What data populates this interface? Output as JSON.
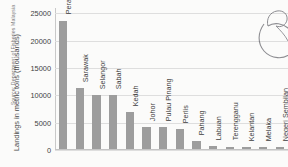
{
  "figure": {
    "source_note": "Source: Department of Fisheries Malaysia",
    "artifact": "pen-scribble-artifact"
  },
  "chart_data": {
    "type": "bar",
    "title": "",
    "xlabel": "",
    "ylabel": "Landings in metric tons (thousands)",
    "ylim": [
      0,
      26000
    ],
    "yticks": [
      "0",
      "5000",
      "10000",
      "15000",
      "20000",
      "25000"
    ],
    "ytick_values": [
      0,
      5000,
      10000,
      15000,
      20000,
      25000
    ],
    "grid": true,
    "legend": "none",
    "label_orientation": "vertical-above-bar",
    "bar_color": "#9d9d9d",
    "categories": [
      "Perak",
      "Sarawak",
      "Selangor",
      "Sabah",
      "Kedah",
      "Johor",
      "Pulau Pinang",
      "Perlis",
      "Pahang",
      "Labuan",
      "Terengganu",
      "Kelantan",
      "Melaka",
      "Negeri Sembilan"
    ],
    "values": [
      23500,
      11100,
      9900,
      9900,
      6800,
      4000,
      4000,
      3600,
      1500,
      500,
      450,
      400,
      350,
      300
    ]
  }
}
